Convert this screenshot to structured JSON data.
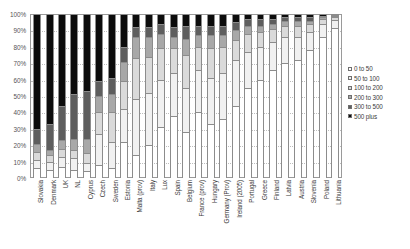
{
  "chart_data": {
    "type": "bar",
    "subtype": "stacked-percent",
    "title": "",
    "xlabel": "",
    "ylabel": "",
    "ylim": [
      0,
      100
    ],
    "y_tick_labels": [
      "100%",
      "90%",
      "80%",
      "70%",
      "60%",
      "50%",
      "40%",
      "30%",
      "20%",
      "10%",
      "0%"
    ],
    "y_tick_values": [
      100,
      90,
      80,
      70,
      60,
      50,
      40,
      30,
      20,
      10,
      0
    ],
    "grid": true,
    "legend_position": "right",
    "categories": [
      "Slovakia",
      "Denmark",
      "UK",
      "NL",
      "Cyprus",
      "Czech",
      "Sweden",
      "Estonia",
      "Malta (prov)",
      "Italy",
      "Lux",
      "Spain",
      "Belgium",
      "France (prov)",
      "Hungary",
      "Germany (Prov)",
      "Ireland (2005)",
      "Portugal",
      "Greece",
      "Finland",
      "Latvia",
      "Austria",
      "Slovenia",
      "Poland",
      "Lithuania"
    ],
    "series": [
      {
        "name": "0 to 50",
        "color": "#ffffff",
        "values": [
          6,
          5,
          7,
          5,
          4,
          8,
          6,
          22,
          14,
          20,
          31,
          38,
          28,
          40,
          33,
          36,
          44,
          55,
          60,
          66,
          70,
          72,
          78,
          86,
          92
        ]
      },
      {
        "name": "50 to 100",
        "color": "#f1f1f1",
        "values": [
          5,
          5,
          6,
          7,
          5,
          19,
          16,
          20,
          34,
          32,
          29,
          26,
          27,
          26,
          28,
          28,
          28,
          22,
          20,
          17,
          16,
          14,
          11,
          8,
          5
        ]
      },
      {
        "name": "100 to 200",
        "color": "#dadada",
        "values": [
          5,
          4,
          5,
          5,
          6,
          13,
          18,
          17,
          25,
          22,
          19,
          15,
          20,
          14,
          18,
          16,
          12,
          11,
          9,
          8,
          7,
          7,
          5,
          3,
          2
        ]
      },
      {
        "name": "200 to 300",
        "color": "#a8a8a8",
        "values": [
          5,
          3,
          5,
          7,
          9,
          10,
          11,
          12,
          13,
          12,
          9,
          7,
          10,
          7,
          8,
          7,
          6,
          5,
          4,
          3,
          3,
          3,
          2,
          1,
          0.5
        ]
      },
      {
        "name": "300 to 500",
        "color": "#5e5e5e",
        "values": [
          9,
          16,
          21,
          27,
          29,
          9,
          10,
          9,
          6,
          6,
          6,
          6,
          8,
          6,
          6,
          6,
          5,
          4,
          4,
          3,
          2,
          2,
          2,
          1,
          0.3
        ]
      },
      {
        "name": "500 plus",
        "color": "#0c0c0c",
        "values": [
          70,
          67,
          56,
          49,
          47,
          41,
          39,
          20,
          8,
          8,
          6,
          8,
          7,
          7,
          7,
          7,
          5,
          3,
          3,
          3,
          2,
          2,
          2,
          1,
          0.2
        ]
      }
    ]
  },
  "legend": {
    "items": [
      {
        "label": "0 to 50"
      },
      {
        "label": "50 to 100"
      },
      {
        "label": "100 to 200"
      },
      {
        "label": "200 to 300"
      },
      {
        "label": "300 to 500"
      },
      {
        "label": "500 plus"
      }
    ]
  }
}
